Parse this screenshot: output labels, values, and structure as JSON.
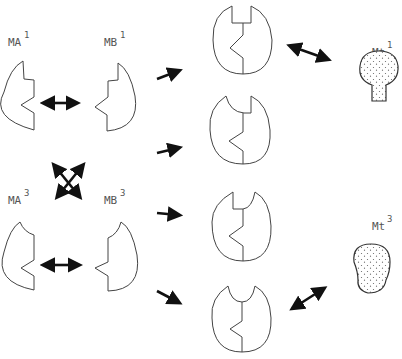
{
  "diagram": {
    "labels": {
      "ma1": {
        "base": "MA",
        "sup": "1"
      },
      "mb1": {
        "base": "MB",
        "sup": "1"
      },
      "ma3": {
        "base": "MA",
        "sup": "3"
      },
      "mb3": {
        "base": "MB",
        "sup": "3"
      },
      "mt1": {
        "base": "Mt",
        "sup": "1"
      },
      "mt3": {
        "base": "Mt",
        "sup": "3"
      }
    },
    "nodes": [
      {
        "id": "ma1",
        "type": "half-subunit-A",
        "notch": "square"
      },
      {
        "id": "mb1",
        "type": "half-subunit-B",
        "notch": "square"
      },
      {
        "id": "ma3",
        "type": "half-subunit-A",
        "notch": "curved"
      },
      {
        "id": "mb3",
        "type": "half-subunit-B",
        "notch": "curved"
      },
      {
        "id": "complex-1",
        "type": "dimer",
        "left_notch": "square",
        "right_notch": "square"
      },
      {
        "id": "complex-2",
        "type": "dimer",
        "left_notch": "curved",
        "right_notch": "square"
      },
      {
        "id": "complex-3",
        "type": "dimer",
        "left_notch": "square",
        "right_notch": "curved"
      },
      {
        "id": "complex-4",
        "type": "dimer",
        "left_notch": "curved",
        "right_notch": "curved"
      },
      {
        "id": "mt1",
        "type": "target-ligand",
        "shape": "bulb-with-stem",
        "fill": "stippled"
      },
      {
        "id": "mt3",
        "type": "target-ligand",
        "shape": "rounded-blob",
        "fill": "stippled"
      }
    ],
    "edges": [
      {
        "from": "ma1",
        "to": "mb1",
        "kind": "bidirectional"
      },
      {
        "from": "ma3",
        "to": "mb3",
        "kind": "bidirectional"
      },
      {
        "from": "ma1",
        "to": "mb3",
        "kind": "bidirectional-cross"
      },
      {
        "from": "ma3",
        "to": "mb1",
        "kind": "bidirectional-cross"
      },
      {
        "from": "pairs",
        "to": "complex-1",
        "kind": "forward"
      },
      {
        "from": "pairs",
        "to": "complex-2",
        "kind": "forward"
      },
      {
        "from": "pairs",
        "to": "complex-3",
        "kind": "forward"
      },
      {
        "from": "pairs",
        "to": "complex-4",
        "kind": "forward"
      },
      {
        "from": "complex-1",
        "to": "mt1",
        "kind": "bidirectional"
      },
      {
        "from": "complex-4",
        "to": "mt3",
        "kind": "bidirectional"
      }
    ],
    "colors": {
      "line": "#444444",
      "arrow": "#111111",
      "label": "#555555",
      "background": "#ffffff"
    }
  }
}
